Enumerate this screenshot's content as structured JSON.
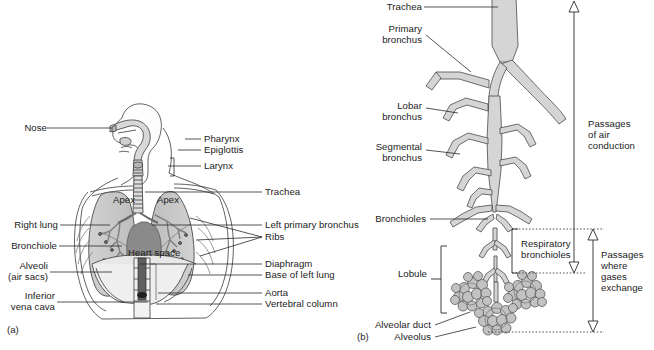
{
  "figure": {
    "width": 654,
    "height": 350,
    "background": "#ffffff",
    "ink": "#1b1b1b",
    "line_color": "#3a3a3a",
    "fill_light": "#e2e2e2",
    "fill_mid": "#c9c9c9",
    "fill_dark": "#8f8f8f",
    "fill_darker": "#6e6e6e"
  },
  "panel_a": {
    "tag": "(a)",
    "labels_left": [
      {
        "text": "Nose",
        "x": 22,
        "y": 123,
        "leader_to_x": 112,
        "leader_y": 128
      },
      {
        "text": "Right lung",
        "x": 2,
        "y": 220,
        "leader_to_x": 110,
        "leader_y": 225
      },
      {
        "text": "Bronchiole",
        "x": 2,
        "y": 241,
        "leader_to_x": 122,
        "leader_y": 246
      },
      {
        "text": "Alveoli",
        "x": 2,
        "y": 261,
        "leader_to_x": 112,
        "leader_y": 272
      },
      {
        "text": "(air sacs)",
        "x": 2,
        "y": 272
      },
      {
        "text": "Inferior",
        "x": 2,
        "y": 291,
        "leader_to_x": 148,
        "leader_y": 302
      },
      {
        "text": "vena cava",
        "x": 2,
        "y": 302
      }
    ],
    "labels_right": [
      {
        "text": "Pharynx",
        "x": 204,
        "y": 134,
        "leader_from_x": 152,
        "leader_y": 139
      },
      {
        "text": "Epiglottis",
        "x": 204,
        "y": 145,
        "leader_from_x": 152,
        "leader_y": 150
      },
      {
        "text": "Larynx",
        "x": 204,
        "y": 161,
        "leader_from_x": 152,
        "leader_y": 166
      },
      {
        "text": "Trachea",
        "x": 265,
        "y": 187,
        "leader_from_x": 142,
        "leader_y": 192
      },
      {
        "text": "Left primary bronchus",
        "x": 265,
        "y": 220,
        "leader_from_x": 152,
        "leader_y": 225
      },
      {
        "text": "Ribs",
        "x": 265,
        "y": 232,
        "leader_from_x": 195,
        "leader_y": 237
      },
      {
        "text": "Diaphragm",
        "x": 265,
        "y": 259,
        "leader_from_x": 140,
        "leader_y": 264
      },
      {
        "text": "Base of left lung",
        "x": 265,
        "y": 270,
        "leader_from_x": 188,
        "leader_y": 275
      },
      {
        "text": "Aorta",
        "x": 265,
        "y": 288,
        "leader_from_x": 160,
        "leader_y": 293
      },
      {
        "text": "Vertebral column",
        "x": 265,
        "y": 299,
        "leader_from_x": 160,
        "leader_y": 304
      }
    ],
    "labels_inner": [
      {
        "text": "Apex",
        "x": 113,
        "y": 195
      },
      {
        "text": "Apex",
        "x": 157,
        "y": 195
      },
      {
        "text": "Heart space",
        "x": 130,
        "y": 248
      }
    ]
  },
  "panel_b": {
    "tag": "(b)",
    "labels_left": [
      {
        "text": "Trachea",
        "x": 44,
        "y": 2,
        "leader_to_x": 155,
        "leader_y": 7
      },
      {
        "text": "Primary",
        "x": 48,
        "y": 24,
        "leader_to_x": 131,
        "leader_y": 72
      },
      {
        "text": "bronchus",
        "x": 42,
        "y": 35
      },
      {
        "text": "Lobar",
        "x": 58,
        "y": 101,
        "leader_to_x": 117,
        "leader_y": 113
      },
      {
        "text": "bronchus",
        "x": 42,
        "y": 112
      },
      {
        "text": "Segmental",
        "x": 35,
        "y": 142,
        "leader_to_x": 120,
        "leader_y": 154
      },
      {
        "text": "bronchus",
        "x": 42,
        "y": 153
      },
      {
        "text": "Bronchioles",
        "x": 30,
        "y": 214,
        "leader_to_x": 143,
        "leader_y": 219
      },
      {
        "text": "Lobule",
        "x": 60,
        "y": 269
      },
      {
        "text": "Alveolar duct",
        "x": 24,
        "y": 320,
        "leader_to_x": 140,
        "leader_y": 311
      },
      {
        "text": "Alveolus",
        "x": 50,
        "y": 332,
        "leader_to_x": 140,
        "leader_y": 327
      }
    ],
    "labels_right": [
      {
        "text": "Passages",
        "x": 248,
        "y": 119
      },
      {
        "text": "of air",
        "x": 248,
        "y": 130
      },
      {
        "text": "conduction",
        "x": 248,
        "y": 141
      },
      {
        "text": "Passages",
        "x": 260,
        "y": 250
      },
      {
        "text": "where",
        "x": 260,
        "y": 261
      },
      {
        "text": "gases",
        "x": 260,
        "y": 272
      },
      {
        "text": "exchange",
        "x": 260,
        "y": 283
      }
    ],
    "labels_inner": [
      {
        "text": "Respiratory",
        "x": 181,
        "y": 239
      },
      {
        "text": "bronchioles",
        "x": 181,
        "y": 250
      }
    ],
    "brackets": {
      "lobule": {
        "x": 101,
        "y_top": 246,
        "y_bottom": 313
      },
      "respiratory_bronchioles": {
        "x": 172,
        "y_top": 229,
        "y_bottom": 273
      }
    },
    "arrows": {
      "air_conduction": {
        "x": 234,
        "y_top": 2,
        "y_bottom": 272
      },
      "gas_exchange": {
        "x": 253,
        "y_top": 229,
        "y_bottom": 332
      }
    },
    "dotted_guides": [
      {
        "y": 229,
        "x1": 172,
        "x2": 262
      },
      {
        "y": 273,
        "x1": 172,
        "x2": 245
      },
      {
        "y": 332,
        "x1": 148,
        "x2": 262
      }
    ]
  }
}
